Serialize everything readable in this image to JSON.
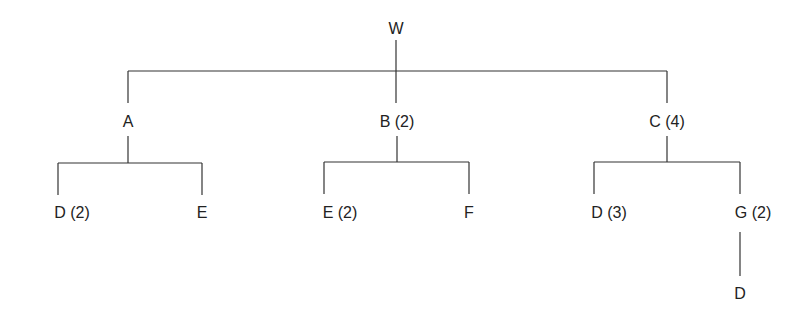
{
  "diagram": {
    "type": "tree",
    "nodes": [
      {
        "id": "W",
        "label": "W",
        "x": 396,
        "y": 29
      },
      {
        "id": "A",
        "label": "A",
        "x": 128,
        "y": 122
      },
      {
        "id": "B",
        "label": "B (2)",
        "x": 397,
        "y": 122
      },
      {
        "id": "C",
        "label": "C (4)",
        "x": 667,
        "y": 122
      },
      {
        "id": "AD",
        "label": "D (2)",
        "x": 72,
        "y": 213
      },
      {
        "id": "AE",
        "label": "E",
        "x": 202,
        "y": 213
      },
      {
        "id": "BE",
        "label": "E (2)",
        "x": 340,
        "y": 213
      },
      {
        "id": "BF",
        "label": "F",
        "x": 469,
        "y": 213
      },
      {
        "id": "CD",
        "label": "D (3)",
        "x": 609,
        "y": 213
      },
      {
        "id": "CG",
        "label": "G (2)",
        "x": 753,
        "y": 213
      },
      {
        "id": "GD",
        "label": "D",
        "x": 740,
        "y": 294
      }
    ],
    "edges": [
      [
        "W",
        "A"
      ],
      [
        "W",
        "B"
      ],
      [
        "W",
        "C"
      ],
      [
        "A",
        "AD"
      ],
      [
        "A",
        "AE"
      ],
      [
        "B",
        "BE"
      ],
      [
        "B",
        "BF"
      ],
      [
        "C",
        "CD"
      ],
      [
        "C",
        "CG"
      ],
      [
        "CG",
        "GD"
      ]
    ],
    "line_color": "#333333"
  }
}
